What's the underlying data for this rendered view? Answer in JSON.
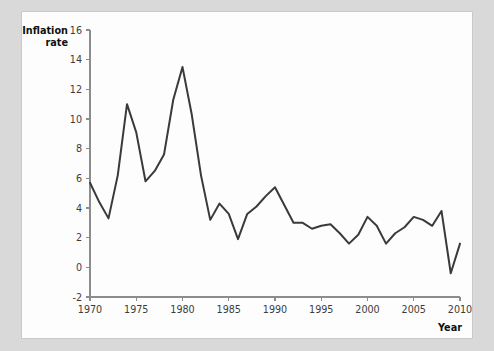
{
  "chart_data": {
    "type": "line",
    "title": "",
    "xlabel": "Year",
    "ylabel": "Inflation rate",
    "ylabel_line1": "Inflation",
    "ylabel_line2": "rate",
    "xlim": [
      1970,
      2010
    ],
    "ylim": [
      -2,
      16
    ],
    "xticks": [
      1970,
      1975,
      1980,
      1985,
      1990,
      1995,
      2000,
      2005,
      2010
    ],
    "yticks": [
      -2,
      0,
      2,
      4,
      6,
      8,
      10,
      12,
      14,
      16
    ],
    "xtick_labels": [
      "1970",
      "1975",
      "1980",
      "1985",
      "1990",
      "1995",
      "2000",
      "2005",
      "2010"
    ],
    "ytick_labels": [
      "-2",
      "0",
      "2",
      "4",
      "6",
      "8",
      "10",
      "12",
      "14",
      "16"
    ],
    "grid": false,
    "legend": false,
    "line_color": "#3a3a3c",
    "axis_color": "#8c8c8c",
    "background_color": "#fdfdfd",
    "page_background_color": "#d9d9d9",
    "x": [
      1970,
      1971,
      1972,
      1973,
      1974,
      1975,
      1976,
      1977,
      1978,
      1979,
      1980,
      1981,
      1982,
      1983,
      1984,
      1985,
      1986,
      1987,
      1988,
      1989,
      1990,
      1991,
      1992,
      1993,
      1994,
      1995,
      1996,
      1997,
      1998,
      1999,
      2000,
      2001,
      2002,
      2003,
      2004,
      2005,
      2006,
      2007,
      2008,
      2009,
      2010
    ],
    "values": [
      5.7,
      4.4,
      3.3,
      6.2,
      11.0,
      9.1,
      5.8,
      6.5,
      7.6,
      11.3,
      13.5,
      10.3,
      6.2,
      3.2,
      4.3,
      3.6,
      1.9,
      3.6,
      4.1,
      4.8,
      5.4,
      4.2,
      3.0,
      3.0,
      2.6,
      2.8,
      2.9,
      2.3,
      1.6,
      2.2,
      3.4,
      2.8,
      1.6,
      2.3,
      2.7,
      3.4,
      3.2,
      2.8,
      3.8,
      -0.4,
      1.6
    ]
  }
}
